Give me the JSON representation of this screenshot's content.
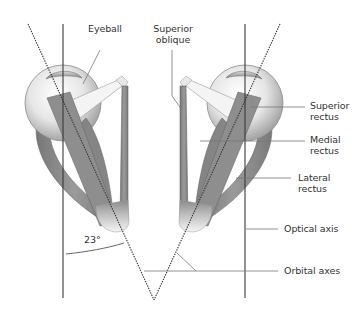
{
  "figure": {
    "labels": {
      "eyeball": "Eyeball",
      "superior_oblique_line1": "Superior",
      "superior_oblique_line2": "oblique",
      "superior_rectus_line1": "Superior",
      "superior_rectus_line2": "rectus",
      "medial_rectus_line1": "Medial",
      "medial_rectus_line2": "rectus",
      "lateral_rectus_line1": "Lateral",
      "lateral_rectus_line2": "rectus",
      "optical_axis": "Optical axis",
      "orbital_axes": "Orbital axes",
      "angle": "23°"
    },
    "colors": {
      "background": "#ffffff",
      "axis_line": "#3a3a3a",
      "leader_line": "#777777",
      "muscle": "#8e8e8e",
      "muscle_dark": "#6f6f6f",
      "tendon": "#f2f2f2",
      "eyeball_light": "#f4f4f4",
      "eyeball_shade": "#a9a9a9",
      "text": "#333333"
    }
  }
}
